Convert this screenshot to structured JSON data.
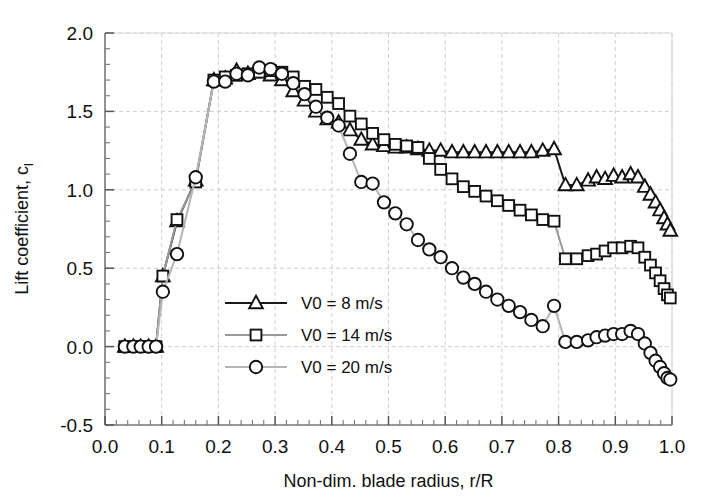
{
  "chart_data": {
    "type": "line",
    "title": "",
    "xlabel": "Non-dim. blade radius, r/R",
    "ylabel": "Lift coefficient, c",
    "ylabel_sub": "l",
    "xlim": [
      0.0,
      1.0
    ],
    "ylim": [
      -0.5,
      2.0
    ],
    "xticks": [
      "0.0",
      "0.1",
      "0.2",
      "0.3",
      "0.4",
      "0.5",
      "0.6",
      "0.7",
      "0.8",
      "0.9",
      "1.0"
    ],
    "xtick_values": [
      0.0,
      0.1,
      0.2,
      0.3,
      0.4,
      0.5,
      0.6,
      0.7,
      0.8,
      0.9,
      1.0
    ],
    "yticks": [
      "2.0",
      "1.5",
      "1.0",
      "0.5",
      "0.0",
      "-0.5"
    ],
    "ytick_values": [
      2.0,
      1.5,
      1.0,
      0.5,
      0.0,
      -0.5
    ],
    "grid": true,
    "minor_ticks_per_interval": 5,
    "legend_position": "center-left",
    "series": [
      {
        "name": "V0 = 8 m/s",
        "marker": "triangle",
        "color": "#1a1a1a",
        "line_color": "#1a1a1a",
        "points": [
          [
            0.035,
            0.0
          ],
          [
            0.05,
            0.0
          ],
          [
            0.063,
            0.0
          ],
          [
            0.077,
            0.0
          ],
          [
            0.09,
            0.0
          ],
          [
            0.102,
            0.45
          ],
          [
            0.127,
            0.8
          ],
          [
            0.16,
            1.06
          ],
          [
            0.192,
            1.7
          ],
          [
            0.212,
            1.71
          ],
          [
            0.232,
            1.76
          ],
          [
            0.252,
            1.74
          ],
          [
            0.272,
            1.75
          ],
          [
            0.292,
            1.73
          ],
          [
            0.312,
            1.7
          ],
          [
            0.332,
            1.63
          ],
          [
            0.352,
            1.57
          ],
          [
            0.372,
            1.5
          ],
          [
            0.392,
            1.45
          ],
          [
            0.412,
            1.43
          ],
          [
            0.432,
            1.38
          ],
          [
            0.452,
            1.32
          ],
          [
            0.472,
            1.29
          ],
          [
            0.492,
            1.28
          ],
          [
            0.512,
            1.27
          ],
          [
            0.532,
            1.27
          ],
          [
            0.552,
            1.26
          ],
          [
            0.572,
            1.25
          ],
          [
            0.592,
            1.25
          ],
          [
            0.612,
            1.24
          ],
          [
            0.632,
            1.24
          ],
          [
            0.652,
            1.24
          ],
          [
            0.672,
            1.24
          ],
          [
            0.692,
            1.24
          ],
          [
            0.712,
            1.24
          ],
          [
            0.732,
            1.24
          ],
          [
            0.752,
            1.24
          ],
          [
            0.772,
            1.25
          ],
          [
            0.792,
            1.26
          ],
          [
            0.812,
            1.03
          ],
          [
            0.832,
            1.03
          ],
          [
            0.852,
            1.06
          ],
          [
            0.867,
            1.08
          ],
          [
            0.882,
            1.07
          ],
          [
            0.897,
            1.09
          ],
          [
            0.912,
            1.08
          ],
          [
            0.927,
            1.1
          ],
          [
            0.94,
            1.08
          ],
          [
            0.952,
            1.02
          ],
          [
            0.962,
            0.97
          ],
          [
            0.971,
            0.92
          ],
          [
            0.979,
            0.87
          ],
          [
            0.986,
            0.82
          ],
          [
            0.992,
            0.78
          ],
          [
            0.997,
            0.74
          ]
        ]
      },
      {
        "name": "V0 = 14 m/s",
        "marker": "square",
        "color": "#1a1a1a",
        "line_color": "#9a9a9a",
        "points": [
          [
            0.035,
            0.0
          ],
          [
            0.05,
            0.0
          ],
          [
            0.063,
            0.0
          ],
          [
            0.077,
            0.0
          ],
          [
            0.09,
            0.0
          ],
          [
            0.102,
            0.45
          ],
          [
            0.127,
            0.81
          ],
          [
            0.16,
            1.05
          ],
          [
            0.192,
            1.7
          ],
          [
            0.212,
            1.72
          ],
          [
            0.232,
            1.73
          ],
          [
            0.252,
            1.74
          ],
          [
            0.272,
            1.75
          ],
          [
            0.292,
            1.76
          ],
          [
            0.312,
            1.75
          ],
          [
            0.332,
            1.72
          ],
          [
            0.352,
            1.66
          ],
          [
            0.372,
            1.64
          ],
          [
            0.392,
            1.59
          ],
          [
            0.412,
            1.55
          ],
          [
            0.432,
            1.47
          ],
          [
            0.452,
            1.42
          ],
          [
            0.472,
            1.36
          ],
          [
            0.492,
            1.32
          ],
          [
            0.512,
            1.29
          ],
          [
            0.532,
            1.28
          ],
          [
            0.552,
            1.27
          ],
          [
            0.572,
            1.2
          ],
          [
            0.592,
            1.13
          ],
          [
            0.612,
            1.07
          ],
          [
            0.632,
            1.02
          ],
          [
            0.652,
            0.99
          ],
          [
            0.672,
            0.96
          ],
          [
            0.692,
            0.93
          ],
          [
            0.712,
            0.9
          ],
          [
            0.732,
            0.87
          ],
          [
            0.752,
            0.84
          ],
          [
            0.772,
            0.81
          ],
          [
            0.792,
            0.8
          ],
          [
            0.812,
            0.56
          ],
          [
            0.832,
            0.56
          ],
          [
            0.852,
            0.58
          ],
          [
            0.867,
            0.59
          ],
          [
            0.882,
            0.61
          ],
          [
            0.897,
            0.63
          ],
          [
            0.912,
            0.63
          ],
          [
            0.927,
            0.64
          ],
          [
            0.94,
            0.63
          ],
          [
            0.952,
            0.57
          ],
          [
            0.962,
            0.52
          ],
          [
            0.971,
            0.47
          ],
          [
            0.979,
            0.42
          ],
          [
            0.986,
            0.37
          ],
          [
            0.992,
            0.33
          ],
          [
            0.997,
            0.31
          ]
        ]
      },
      {
        "name": "V0 = 20 m/s",
        "marker": "circle",
        "color": "#1a1a1a",
        "line_color": "#b5b5b5",
        "points": [
          [
            0.035,
            0.0
          ],
          [
            0.05,
            0.0
          ],
          [
            0.063,
            0.0
          ],
          [
            0.077,
            0.0
          ],
          [
            0.09,
            0.0
          ],
          [
            0.102,
            0.35
          ],
          [
            0.127,
            0.59
          ],
          [
            0.16,
            1.08
          ],
          [
            0.192,
            1.69
          ],
          [
            0.212,
            1.69
          ],
          [
            0.232,
            1.74
          ],
          [
            0.252,
            1.73
          ],
          [
            0.272,
            1.78
          ],
          [
            0.292,
            1.77
          ],
          [
            0.312,
            1.74
          ],
          [
            0.332,
            1.68
          ],
          [
            0.352,
            1.61
          ],
          [
            0.372,
            1.53
          ],
          [
            0.392,
            1.46
          ],
          [
            0.412,
            1.41
          ],
          [
            0.432,
            1.23
          ],
          [
            0.452,
            1.05
          ],
          [
            0.472,
            1.04
          ],
          [
            0.492,
            0.92
          ],
          [
            0.512,
            0.85
          ],
          [
            0.532,
            0.78
          ],
          [
            0.552,
            0.68
          ],
          [
            0.572,
            0.62
          ],
          [
            0.592,
            0.57
          ],
          [
            0.612,
            0.5
          ],
          [
            0.632,
            0.44
          ],
          [
            0.652,
            0.4
          ],
          [
            0.672,
            0.35
          ],
          [
            0.692,
            0.3
          ],
          [
            0.712,
            0.26
          ],
          [
            0.732,
            0.22
          ],
          [
            0.752,
            0.17
          ],
          [
            0.772,
            0.13
          ],
          [
            0.792,
            0.26
          ],
          [
            0.812,
            0.03
          ],
          [
            0.832,
            0.03
          ],
          [
            0.852,
            0.04
          ],
          [
            0.867,
            0.06
          ],
          [
            0.882,
            0.07
          ],
          [
            0.897,
            0.08
          ],
          [
            0.912,
            0.08
          ],
          [
            0.927,
            0.1
          ],
          [
            0.94,
            0.08
          ],
          [
            0.952,
            0.02
          ],
          [
            0.962,
            -0.04
          ],
          [
            0.971,
            -0.09
          ],
          [
            0.979,
            -0.13
          ],
          [
            0.986,
            -0.17
          ],
          [
            0.992,
            -0.2
          ],
          [
            0.997,
            -0.21
          ]
        ]
      }
    ]
  },
  "legend": {
    "entries": [
      {
        "label": "V0 = 8 m/s",
        "marker": "triangle"
      },
      {
        "label": "V0 = 14 m/s",
        "marker": "square"
      },
      {
        "label": "V0 = 20 m/s",
        "marker": "circle"
      }
    ]
  }
}
